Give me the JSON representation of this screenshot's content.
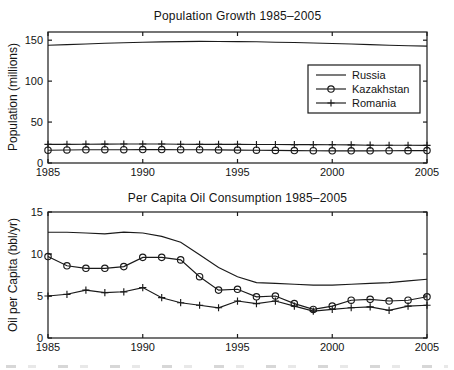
{
  "figure": {
    "background": "#ffffff",
    "ink_color": "#1a1a1a"
  },
  "chart_data": [
    {
      "type": "line",
      "title": "Population Growth 1985–2005",
      "xlabel": "",
      "ylabel": "Population (millions)",
      "x": [
        1985,
        1986,
        1987,
        1988,
        1989,
        1990,
        1991,
        1992,
        1993,
        1994,
        1995,
        1996,
        1997,
        1998,
        1999,
        2000,
        2001,
        2002,
        2003,
        2004,
        2005
      ],
      "xlim": [
        1985,
        2005
      ],
      "ylim": [
        0,
        160
      ],
      "xticks": [
        "1985",
        "1990",
        "1995",
        "2000",
        "2005"
      ],
      "xtick_values": [
        1985,
        1990,
        1995,
        2000,
        2005
      ],
      "yticks": [
        "0",
        "50",
        "100",
        "150"
      ],
      "ytick_values": [
        0,
        50,
        100,
        150
      ],
      "grid": false,
      "legend": {
        "visible": true,
        "position": "inside-upper-right",
        "entries": [
          "Russia",
          "Kazakhstan",
          "Romania"
        ]
      },
      "series": [
        {
          "name": "Russia",
          "marker": "none",
          "color": "#1a1a1a",
          "values": [
            143.8,
            144.6,
            145.4,
            146.2,
            146.9,
            147.5,
            147.9,
            148.3,
            148.5,
            148.4,
            148.3,
            148.0,
            147.6,
            147.2,
            146.6,
            146.0,
            145.3,
            144.6,
            143.9,
            143.3,
            142.8
          ]
        },
        {
          "name": "Kazakhstan",
          "marker": "circle",
          "color": "#1a1a1a",
          "values": [
            15.6,
            15.9,
            16.1,
            16.2,
            16.3,
            16.4,
            16.4,
            16.3,
            16.2,
            16.0,
            15.8,
            15.6,
            15.4,
            15.2,
            15.0,
            14.9,
            14.9,
            14.9,
            15.0,
            15.1,
            15.2
          ]
        },
        {
          "name": "Romania",
          "marker": "plus",
          "color": "#1a1a1a",
          "values": [
            22.8,
            22.9,
            23.0,
            23.1,
            23.2,
            23.2,
            23.2,
            22.9,
            22.8,
            22.7,
            22.7,
            22.6,
            22.6,
            22.5,
            22.5,
            22.4,
            22.1,
            21.8,
            21.7,
            21.7,
            21.6
          ]
        }
      ]
    },
    {
      "type": "line",
      "title": "Per Capita Oil Consumption 1985–2005",
      "xlabel": "",
      "ylabel": "Oil per Capita (bbl/yr)",
      "x": [
        1985,
        1986,
        1987,
        1988,
        1989,
        1990,
        1991,
        1992,
        1993,
        1994,
        1995,
        1996,
        1997,
        1998,
        1999,
        2000,
        2001,
        2002,
        2003,
        2004,
        2005
      ],
      "xlim": [
        1985,
        2005
      ],
      "ylim": [
        0,
        15
      ],
      "xticks": [
        "1985",
        "1990",
        "1995",
        "2000",
        "2005"
      ],
      "xtick_values": [
        1985,
        1990,
        1995,
        2000,
        2005
      ],
      "yticks": [
        "0",
        "5",
        "10",
        "15"
      ],
      "ytick_values": [
        0,
        5,
        10,
        15
      ],
      "grid": false,
      "legend": {
        "visible": false,
        "entries": []
      },
      "series": [
        {
          "name": "Russia",
          "marker": "none",
          "color": "#1a1a1a",
          "values": [
            12.6,
            12.6,
            12.5,
            12.4,
            12.6,
            12.5,
            12.1,
            11.4,
            9.9,
            8.4,
            7.3,
            6.6,
            6.5,
            6.4,
            6.3,
            6.3,
            6.4,
            6.5,
            6.6,
            6.8,
            7.0
          ]
        },
        {
          "name": "Kazakhstan",
          "marker": "circle",
          "color": "#1a1a1a",
          "values": [
            9.7,
            8.6,
            8.3,
            8.3,
            8.5,
            9.6,
            9.6,
            9.3,
            7.3,
            5.7,
            5.8,
            4.9,
            5.0,
            4.1,
            3.4,
            3.8,
            4.5,
            4.6,
            4.4,
            4.5,
            4.9
          ]
        },
        {
          "name": "Romania",
          "marker": "plus",
          "color": "#1a1a1a",
          "values": [
            5.0,
            5.2,
            5.7,
            5.4,
            5.5,
            6.0,
            4.8,
            4.2,
            3.9,
            3.6,
            4.4,
            4.1,
            4.4,
            3.8,
            3.2,
            3.4,
            3.6,
            3.7,
            3.3,
            3.8,
            3.9
          ]
        }
      ]
    }
  ]
}
